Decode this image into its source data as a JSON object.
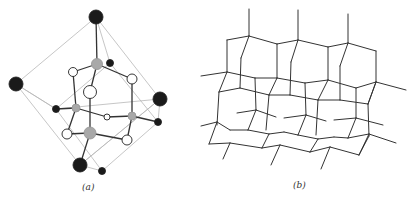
{
  "figure": {
    "panels": [
      {
        "id": "a",
        "caption": "(a)",
        "description": "Unit cell ball-and-stick structure inside a cube outline",
        "colors": {
          "cube_edge": "#b8b8b8",
          "bond": "#333333",
          "black_atom": "#1a1a1a",
          "grey_atom": "#a8a8a8",
          "white_atom": "#ffffff"
        },
        "cube_lines": [
          [
            96,
            17,
            16,
            84
          ],
          [
            96,
            17,
            160,
            99
          ],
          [
            16,
            84,
            80,
            165
          ],
          [
            160,
            99,
            80,
            165
          ],
          [
            96,
            17,
            110,
            63
          ],
          [
            16,
            84,
            56,
            109
          ],
          [
            160,
            99,
            158,
            122
          ],
          [
            80,
            165,
            102,
            171
          ],
          [
            110,
            63,
            158,
            122
          ],
          [
            56,
            109,
            102,
            171
          ],
          [
            158,
            122,
            102,
            171
          ],
          [
            110,
            63,
            56,
            109
          ],
          [
            16,
            84,
            56,
            109
          ],
          [
            56,
            109,
            160,
            99
          ],
          [
            80,
            165,
            160,
            99
          ]
        ],
        "bonds": [
          [
            96,
            17,
            97,
            64
          ],
          [
            97,
            64,
            73,
            72
          ],
          [
            97,
            64,
            132,
            79
          ],
          [
            97,
            64,
            90,
            92
          ],
          [
            73,
            72,
            76,
            108
          ],
          [
            132,
            79,
            132,
            116
          ],
          [
            90,
            92,
            90,
            133
          ],
          [
            76,
            108,
            56,
            109
          ],
          [
            76,
            108,
            107,
            117
          ],
          [
            76,
            108,
            67,
            134
          ],
          [
            107,
            117,
            132,
            116
          ],
          [
            132,
            116,
            158,
            122
          ],
          [
            132,
            116,
            127,
            140
          ],
          [
            90,
            133,
            67,
            134
          ],
          [
            90,
            133,
            127,
            140
          ],
          [
            90,
            133,
            80,
            165
          ]
        ],
        "atoms": [
          {
            "x": 96,
            "y": 17,
            "r": 7,
            "type": "black"
          },
          {
            "x": 16,
            "y": 84,
            "r": 7,
            "type": "black"
          },
          {
            "x": 160,
            "y": 99,
            "r": 7,
            "type": "black"
          },
          {
            "x": 80,
            "y": 165,
            "r": 7,
            "type": "black"
          },
          {
            "x": 110,
            "y": 63,
            "r": 3.5,
            "type": "black"
          },
          {
            "x": 56,
            "y": 109,
            "r": 3.5,
            "type": "black"
          },
          {
            "x": 158,
            "y": 122,
            "r": 3.5,
            "type": "black"
          },
          {
            "x": 102,
            "y": 171,
            "r": 3.5,
            "type": "black"
          },
          {
            "x": 97,
            "y": 64,
            "r": 5.5,
            "type": "grey"
          },
          {
            "x": 76,
            "y": 108,
            "r": 4,
            "type": "grey"
          },
          {
            "x": 132,
            "y": 116,
            "r": 4,
            "type": "grey"
          },
          {
            "x": 90,
            "y": 133,
            "r": 6,
            "type": "grey"
          },
          {
            "x": 73,
            "y": 72,
            "r": 4.5,
            "type": "white"
          },
          {
            "x": 132,
            "y": 79,
            "r": 5,
            "type": "white"
          },
          {
            "x": 90,
            "y": 92,
            "r": 6.5,
            "type": "white"
          },
          {
            "x": 107,
            "y": 117,
            "r": 3,
            "type": "white"
          },
          {
            "x": 67,
            "y": 134,
            "r": 5,
            "type": "white"
          },
          {
            "x": 127,
            "y": 140,
            "r": 5,
            "type": "white"
          }
        ]
      },
      {
        "id": "b",
        "caption": "(b)",
        "description": "Extended tetrahedral network (wireframe lattice)",
        "colors": {
          "line": "#333333"
        },
        "lines": [
          [
            49,
            9,
            49,
            36
          ],
          [
            98,
            10,
            98,
            40
          ],
          [
            148,
            14,
            148,
            43
          ],
          [
            49,
            36,
            27,
            40
          ],
          [
            49,
            36,
            77,
            44
          ],
          [
            98,
            40,
            77,
            44
          ],
          [
            98,
            40,
            128,
            47
          ],
          [
            148,
            43,
            128,
            47
          ],
          [
            148,
            43,
            176,
            51
          ],
          [
            27,
            40,
            27,
            72
          ],
          [
            49,
            36,
            41,
            58
          ],
          [
            41,
            58,
            40,
            88
          ],
          [
            77,
            44,
            77,
            78
          ],
          [
            98,
            40,
            91,
            62
          ],
          [
            91,
            62,
            90,
            95
          ],
          [
            128,
            47,
            128,
            80
          ],
          [
            148,
            43,
            140,
            66
          ],
          [
            140,
            66,
            140,
            100
          ],
          [
            176,
            51,
            176,
            82
          ],
          [
            1,
            76,
            27,
            72
          ],
          [
            27,
            72,
            55,
            78
          ],
          [
            55,
            78,
            77,
            78
          ],
          [
            77,
            78,
            105,
            83
          ],
          [
            105,
            83,
            128,
            80
          ],
          [
            128,
            80,
            156,
            88
          ],
          [
            156,
            88,
            176,
            82
          ],
          [
            176,
            82,
            206,
            90
          ],
          [
            27,
            72,
            19,
            92
          ],
          [
            19,
            92,
            40,
            88
          ],
          [
            40,
            88,
            69,
            95
          ],
          [
            69,
            95,
            90,
            95
          ],
          [
            90,
            95,
            118,
            100
          ],
          [
            118,
            100,
            140,
            100
          ],
          [
            140,
            100,
            168,
            104
          ],
          [
            168,
            104,
            176,
            82
          ],
          [
            55,
            78,
            56,
            110
          ],
          [
            105,
            83,
            106,
            115
          ],
          [
            156,
            88,
            156,
            118
          ],
          [
            77,
            78,
            69,
            95
          ],
          [
            128,
            80,
            118,
            100
          ],
          [
            176,
            82,
            168,
            104
          ],
          [
            19,
            92,
            17,
            125
          ],
          [
            69,
            95,
            66,
            130
          ],
          [
            118,
            100,
            116,
            135
          ],
          [
            168,
            104,
            169,
            136
          ],
          [
            37,
            113,
            56,
            110
          ],
          [
            56,
            110,
            76,
            117
          ],
          [
            84,
            118,
            106,
            115
          ],
          [
            106,
            115,
            126,
            121
          ],
          [
            134,
            120,
            156,
            118
          ],
          [
            156,
            118,
            183,
            125
          ],
          [
            56,
            110,
            48,
            130
          ],
          [
            106,
            115,
            98,
            135
          ],
          [
            156,
            118,
            148,
            138
          ],
          [
            1,
            126,
            17,
            122
          ],
          [
            17,
            122,
            30,
            130
          ],
          [
            17,
            122,
            9,
            144
          ],
          [
            9,
            144,
            30,
            143
          ],
          [
            30,
            130,
            48,
            130
          ],
          [
            48,
            130,
            69,
            134
          ],
          [
            69,
            134,
            84,
            132
          ],
          [
            84,
            132,
            98,
            135
          ],
          [
            98,
            135,
            118,
            139
          ],
          [
            118,
            139,
            134,
            137
          ],
          [
            134,
            137,
            148,
            138
          ],
          [
            148,
            138,
            169,
            134
          ],
          [
            169,
            134,
            196,
            143
          ],
          [
            30,
            143,
            62,
            148
          ],
          [
            62,
            148,
            80,
            145
          ],
          [
            80,
            145,
            110,
            152
          ],
          [
            110,
            152,
            130,
            147
          ],
          [
            130,
            147,
            159,
            155
          ],
          [
            159,
            155,
            169,
            134
          ],
          [
            30,
            143,
            23,
            159
          ],
          [
            80,
            145,
            71,
            165
          ],
          [
            130,
            147,
            121,
            169
          ],
          [
            69,
            134,
            62,
            148
          ],
          [
            118,
            139,
            110,
            152
          ],
          [
            169,
            136,
            159,
            155
          ]
        ]
      }
    ]
  }
}
